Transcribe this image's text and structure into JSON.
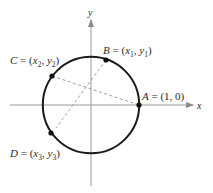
{
  "diagram": {
    "type": "unit-circle",
    "axes": {
      "x_label": "x",
      "y_label": "y"
    },
    "points": [
      {
        "id": "A",
        "name": "A",
        "coords": "(1, 0)"
      },
      {
        "id": "B",
        "name": "B",
        "coords": "(x1, y1)",
        "x_sub": "1",
        "y_sub": "1"
      },
      {
        "id": "C",
        "name": "C",
        "coords": "(x2, y2)",
        "x_sub": "2",
        "y_sub": "2"
      },
      {
        "id": "D",
        "name": "D",
        "coords": "(x3, y3)",
        "x_sub": "3",
        "y_sub": "3"
      }
    ],
    "labels": {
      "A": {
        "name": "A",
        "eq": " = ",
        "value": "(1, 0)"
      },
      "B": {
        "name": "B",
        "eq": " = ",
        "open": "(",
        "x": "x",
        "xs": "1",
        "comma": ", ",
        "y": "y",
        "ys": "1",
        "close": ")"
      },
      "C": {
        "name": "C",
        "eq": " = ",
        "open": "(",
        "x": "x",
        "xs": "2",
        "comma": ", ",
        "y": "y",
        "ys": "2",
        "close": ")"
      },
      "D": {
        "name": "D",
        "eq": " = ",
        "open": "(",
        "x": "x",
        "xs": "3",
        "comma": ", ",
        "y": "y",
        "ys": "3",
        "close": ")"
      }
    },
    "segments": [
      {
        "from": "C",
        "to": "A",
        "style": "dashed"
      },
      {
        "from": "B",
        "to": "D",
        "style": "dashed"
      }
    ],
    "colors": {
      "circle": "#1a1a1a",
      "axis": "#9a9a9a",
      "dashed": "#a0a0a0",
      "point": "#111111",
      "text": "#2a2a2a"
    }
  }
}
